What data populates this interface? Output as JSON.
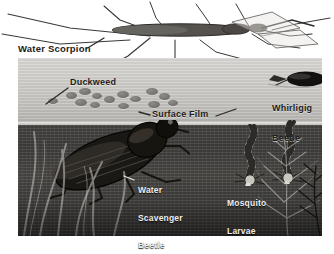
{
  "illustration": {
    "title": "Pond Surface and Underwater Life",
    "medium": "grayscale scientific illustration",
    "zones": [
      {
        "name": "above-water",
        "label": "air and water surface"
      },
      {
        "name": "surface-film",
        "label": "surface film"
      },
      {
        "name": "below-water",
        "label": "underwater"
      }
    ]
  },
  "labels": {
    "water_scorpion": "Water Scorpion",
    "duckweed": "Duckweed",
    "surface_film": "Surface Film",
    "whirligig_line1": "Whirligig",
    "whirligig_line2": "Beetle",
    "scavenger_line1": "Water",
    "scavenger_line2": "Scavenger",
    "scavenger_line3": "Beetle",
    "mosquito_line1": "Mosquito",
    "mosquito_line2": "Larvae"
  },
  "organisms": [
    {
      "id": "water-scorpion",
      "name": "Water Scorpion",
      "zone": "above-water",
      "count": 1
    },
    {
      "id": "duckweed",
      "name": "Duckweed",
      "zone": "surface-film",
      "count": 14
    },
    {
      "id": "whirligig",
      "name": "Whirligig Beetle",
      "zone": "surface-film",
      "count": 1
    },
    {
      "id": "scavenger",
      "name": "Water Scavenger Beetle",
      "zone": "below-water",
      "count": 1
    },
    {
      "id": "mosquito-larvae",
      "name": "Mosquito Larvae",
      "zone": "below-water",
      "count": 2
    }
  ],
  "colors": {
    "page_background": "#ffffff",
    "water_above": "#cfcdc9",
    "surface_line": "#efeeec",
    "water_below": "#434240",
    "label_dark": "#1d1b19",
    "label_light": "#f0efed",
    "ink": "#2a2927"
  }
}
